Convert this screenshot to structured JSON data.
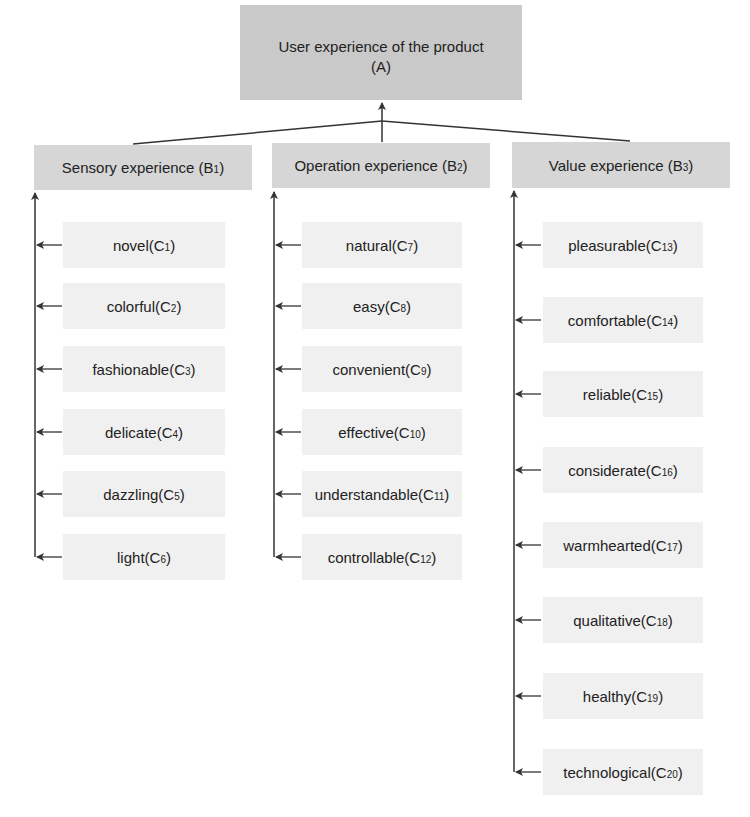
{
  "root": {
    "label_line1": "User experience of the product",
    "label_line2": "(A)"
  },
  "categories": [
    {
      "label": "Sensory experience (B",
      "sub": "1",
      "close": ")",
      "items": [
        {
          "label": "novel(C",
          "sub": "1",
          "close": ")"
        },
        {
          "label": "colorful(C",
          "sub": "2",
          "close": ")"
        },
        {
          "label": "fashionable(C",
          "sub": "3",
          "close": ")"
        },
        {
          "label": "delicate(C",
          "sub": "4",
          "close": ")"
        },
        {
          "label": "dazzling(C",
          "sub": "5",
          "close": ")"
        },
        {
          "label": "light(C",
          "sub": "6",
          "close": ")"
        }
      ]
    },
    {
      "label": "Operation experience (B",
      "sub": "2",
      "close": ")",
      "items": [
        {
          "label": "natural(C",
          "sub": "7",
          "close": ")"
        },
        {
          "label": "easy(C",
          "sub": "8",
          "close": ")"
        },
        {
          "label": "convenient(C",
          "sub": "9",
          "close": ")"
        },
        {
          "label": "effective(C",
          "sub": "10",
          "close": ")"
        },
        {
          "label": "understandable(C",
          "sub": "11",
          "close": ")"
        },
        {
          "label": "controllable(C",
          "sub": "12",
          "close": ")"
        }
      ]
    },
    {
      "label": "Value experience (B",
      "sub": "3",
      "close": ")",
      "items": [
        {
          "label": "pleasurable(C",
          "sub": "13",
          "close": ")"
        },
        {
          "label": "comfortable(C",
          "sub": "14",
          "close": ")"
        },
        {
          "label": "reliable(C",
          "sub": "15",
          "close": ")"
        },
        {
          "label": "considerate(C",
          "sub": "16",
          "close": ")"
        },
        {
          "label": "warmhearted(C",
          "sub": "17",
          "close": ")"
        },
        {
          "label": "qualitative(C",
          "sub": "18",
          "close": ")"
        },
        {
          "label": "healthy(C",
          "sub": "19",
          "close": ")"
        },
        {
          "label": "technological(C",
          "sub": "20",
          "close": ")"
        }
      ]
    }
  ],
  "colors": {
    "root_fill": "#c9c9c9",
    "category_fill": "#d6d6d6",
    "item_fill": "#f0f0f0",
    "line": "#333333"
  }
}
